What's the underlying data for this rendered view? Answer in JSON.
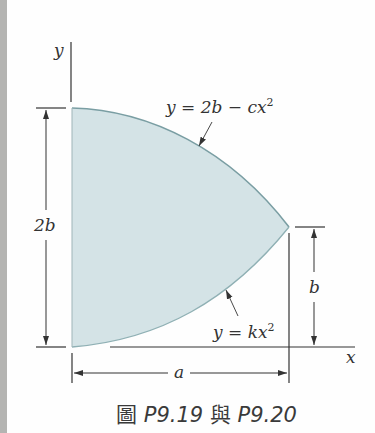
{
  "figure": {
    "caption": {
      "prefix": "圖",
      "label1": "P9.19",
      "conjunction": "與",
      "label2": "P9.20"
    },
    "axes": {
      "x_label": "x",
      "y_label": "y"
    },
    "curves": {
      "upper": {
        "eq_lhs": "y = 2b − cx",
        "eq_exp": "2"
      },
      "lower": {
        "eq_lhs": "y = kx",
        "eq_exp": "2"
      }
    },
    "dimensions": {
      "height_total": "2b",
      "height_tip": "b",
      "width": "a"
    },
    "colors": {
      "region_fill": "#d4e3e6",
      "curve_stroke": "#7a9ea3",
      "line_color": "#333333",
      "side_strip": "#b4b4b2"
    }
  }
}
